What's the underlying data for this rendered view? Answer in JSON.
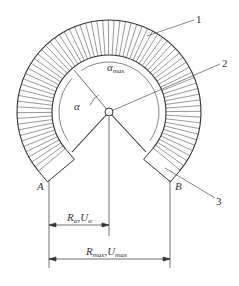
{
  "labels": {
    "callout_1": "1",
    "callout_2": "2",
    "callout_3": "3",
    "point_a": "A",
    "point_b": "B",
    "alpha": "α",
    "alpha_max": "α",
    "alpha_max_sub": "max",
    "ra_main": "R",
    "ra_sub": "α",
    "ua_main": "U",
    "ua_sub": "α",
    "rmax_main": "R",
    "rmax_sub": "max",
    "umax_main": "U",
    "umax_sub": "max",
    "sep": ","
  },
  "colors": {
    "line": "#333333",
    "background": "#ffffff"
  }
}
